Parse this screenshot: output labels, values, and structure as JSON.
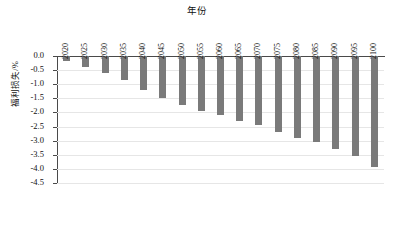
{
  "chart_data": {
    "type": "bar",
    "title": "年份",
    "xlabel": "年份",
    "ylabel": "福利损失/%",
    "categories": [
      "2020",
      "2025",
      "2030",
      "2035",
      "2040",
      "2045",
      "2050",
      "2055",
      "2060",
      "2065",
      "2070",
      "2075",
      "2080",
      "2085",
      "2090",
      "2095",
      "2100"
    ],
    "values": [
      -0.18,
      -0.38,
      -0.6,
      -0.85,
      -1.2,
      -1.5,
      -1.72,
      -1.95,
      -2.1,
      -2.3,
      -2.45,
      -2.7,
      -2.9,
      -3.05,
      -3.3,
      -3.55,
      -3.95
    ],
    "ylim": [
      -4.5,
      0.0
    ],
    "ytick_labels": [
      "0.0",
      "-0.5",
      "-1.0",
      "-1.5",
      "-2.0",
      "-2.5",
      "-3.0",
      "-3.5",
      "-4.0",
      "-4.5"
    ],
    "ytick_values": [
      0.0,
      -0.5,
      -1.0,
      -1.5,
      -2.0,
      -2.5,
      -3.0,
      -3.5,
      -4.0,
      -4.5
    ],
    "grid": true,
    "legend": "none",
    "bar_color": "#7a7a7a",
    "axis_color": "#4a4a4a",
    "grid_color": "#e6e6e6"
  }
}
